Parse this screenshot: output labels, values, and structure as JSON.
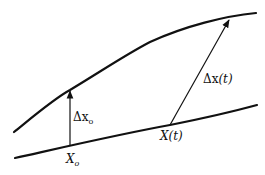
{
  "diagram": {
    "curves": [
      {
        "name": "perturbed-trajectory",
        "description": "upper curve"
      },
      {
        "name": "reference-trajectory",
        "description": "lower line"
      }
    ],
    "labels": {
      "initial_displacement": {
        "main": "Δx",
        "sub": "o"
      },
      "final_displacement": {
        "main": "Δx",
        "arg": "(t)"
      },
      "initial_point": {
        "main": "X",
        "sub": "o"
      },
      "trajectory_point": {
        "main": "X",
        "arg": "(t)"
      }
    },
    "colors": {
      "stroke": "#111111",
      "background": "#ffffff"
    }
  }
}
